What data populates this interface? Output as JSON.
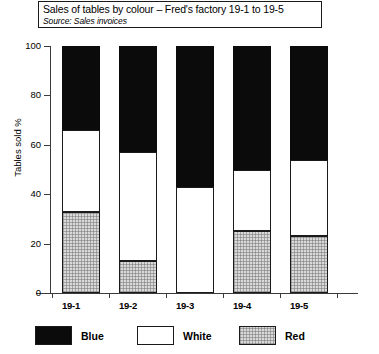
{
  "chart_data": {
    "type": "bar",
    "subtype": "stacked-bar-100",
    "title": "Sales of tables by colour – Fred's factory 19-1 to 19-5",
    "subtitle": "Source: Sales invoices",
    "xlabel": "",
    "ylabel": "Tables sold  %",
    "ylim": [
      0,
      100
    ],
    "yticks": [
      0,
      20,
      40,
      60,
      80,
      100
    ],
    "ytick_labels": [
      "0",
      "20",
      "40",
      "60",
      "80",
      "100"
    ],
    "grid": false,
    "legend_position": "bottom",
    "categories": [
      "19-1",
      "19-2",
      "19-3",
      "19-4",
      "19-5"
    ],
    "series": [
      {
        "name": "Red",
        "color": "#d9d9d9",
        "values": [
          33,
          13,
          0,
          25,
          23
        ]
      },
      {
        "name": "White",
        "color": "#ffffff",
        "values": [
          33,
          44,
          43,
          25,
          31
        ]
      },
      {
        "name": "Blue",
        "color": "#0b0b0b",
        "values": [
          34,
          43,
          57,
          50,
          46
        ]
      }
    ],
    "cumulative_tops": {
      "red": [
        33,
        13,
        0,
        25,
        23
      ],
      "white": [
        66,
        57,
        43,
        50,
        54
      ],
      "blue": [
        100,
        100,
        100,
        100,
        100
      ]
    }
  },
  "legend": {
    "items": [
      {
        "label": "Blue",
        "swatch": "black-swatch"
      },
      {
        "label": "White",
        "swatch": "white-swatch"
      },
      {
        "label": "Red",
        "swatch": "stipple-swatch"
      }
    ]
  }
}
